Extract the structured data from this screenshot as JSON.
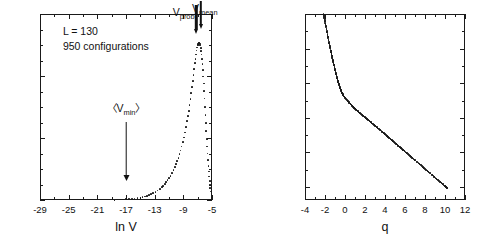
{
  "figure": {
    "background": "#ffffff",
    "ink": "#1a1a1a"
  },
  "left_panel": {
    "annotations": {
      "line1": "L = 130",
      "line2": "950 configurations",
      "v_prob": "V",
      "v_prob_sub": "prob",
      "v_mean": "V",
      "v_mean_sub": "mean",
      "v_min_open": "〈V",
      "v_min_sub": "min",
      "v_min_close": "〉"
    },
    "xlabel": "ln V",
    "ylabel": "",
    "xticks": [
      "-29",
      "-25",
      "-21",
      "-17",
      "-13",
      "-9",
      "-5"
    ],
    "yticks": [
      "0",
      "0.001",
      "0.002",
      "0.003"
    ]
  },
  "right_panel": {
    "xlabel": "q",
    "ylabel_base": "τ",
    "ylabel_sup": "V",
    "ylabel_tail": "(q)",
    "xticks": [
      "-4",
      "-2",
      "0",
      "2",
      "4",
      "6",
      "8",
      "10",
      "12"
    ],
    "yticks": [
      "-8",
      "-4",
      "0",
      "4",
      "8",
      "12"
    ]
  },
  "chart_data": [
    {
      "type": "scatter",
      "id": "distribution-of-ln-V",
      "title": "",
      "xlabel": "ln V",
      "ylabel": "P(ln V)",
      "xlim": [
        -29,
        -5
      ],
      "ylim": [
        0,
        0.003
      ],
      "xticks": [
        -29,
        -25,
        -21,
        -17,
        -13,
        -9,
        -5
      ],
      "yticks": [
        0,
        0.001,
        0.002,
        0.003
      ],
      "grid": false,
      "legend": null,
      "annotations": [
        {
          "text": "L = 130",
          "x": -25.5,
          "y": 0.00272
        },
        {
          "text": "950 configurations",
          "x": -25.5,
          "y": 0.0025
        },
        {
          "text": "〈V_min〉",
          "x": -17.0,
          "y": 0.00148,
          "arrow_to_y": 0.00035
        },
        {
          "text": "V_prob",
          "x": -7.6,
          "y": 0.003,
          "arrow_to_y": 0.00262
        },
        {
          "text": "V_mean",
          "x": -6.3,
          "y": 0.003,
          "arrow_to_y": 0.00262
        }
      ],
      "x": [
        -18.6,
        -18.2,
        -17.8,
        -17.4,
        -17.0,
        -16.6,
        -16.2,
        -15.8,
        -15.4,
        -15.0,
        -14.7,
        -14.4,
        -14.1,
        -13.8,
        -13.5,
        -13.2,
        -12.9,
        -12.6,
        -12.3,
        -12.0,
        -11.8,
        -11.6,
        -11.4,
        -11.2,
        -11.0,
        -10.8,
        -10.6,
        -10.4,
        -10.2,
        -10.0,
        -9.85,
        -9.7,
        -9.55,
        -9.4,
        -9.25,
        -9.1,
        -8.95,
        -8.8,
        -8.65,
        -8.5,
        -8.38,
        -8.26,
        -8.14,
        -8.02,
        -7.9,
        -7.8,
        -7.7,
        -7.6,
        -7.5,
        -7.4,
        -7.32,
        -7.24,
        -7.16,
        -7.08,
        -7.0,
        -6.94,
        -6.88,
        -6.82,
        -6.76,
        -6.7,
        -6.64,
        -6.58,
        -6.52,
        -6.46,
        -6.4,
        -6.34,
        -6.28,
        -6.22,
        -6.16,
        -6.1,
        -6.04,
        -5.98,
        -5.92,
        -5.86,
        -5.8,
        -5.74,
        -5.68,
        -5.62,
        -5.56,
        -5.5,
        -5.44,
        -5.38,
        -5.32,
        -5.28,
        -5.24,
        -5.2
      ],
      "y": [
        5e-06,
        7e-06,
        9e-06,
        1.1e-05,
        1.4e-05,
        1.7e-05,
        2.1e-05,
        2.6e-05,
        3.2e-05,
        4e-05,
        4.8e-05,
        5.8e-05,
        6.9e-05,
        8.2e-05,
        9.7e-05,
        0.000114,
        0.000133,
        0.000155,
        0.00018,
        0.000208,
        0.000232,
        0.000258,
        0.000287,
        0.000319,
        0.000354,
        0.000392,
        0.000434,
        0.00048,
        0.00053,
        0.000585,
        0.000632,
        0.000683,
        0.000738,
        0.000798,
        0.000863,
        0.000933,
        0.001009,
        0.001091,
        0.00118,
        0.001276,
        0.001356,
        0.001441,
        0.001531,
        0.001627,
        0.001729,
        0.00182,
        0.001915,
        0.002012,
        0.00211,
        0.002206,
        0.00228,
        0.00235,
        0.002412,
        0.002462,
        0.002498,
        0.002518,
        0.00253,
        0.002534,
        0.00253,
        0.002516,
        0.002492,
        0.002456,
        0.002408,
        0.002348,
        0.002276,
        0.002192,
        0.002098,
        0.001994,
        0.001882,
        0.001762,
        0.001636,
        0.001506,
        0.001374,
        0.001242,
        0.001112,
        0.000986,
        0.000866,
        0.000752,
        0.000646,
        0.000548,
        0.000458,
        0.000378,
        0.000306,
        0.00025,
        0.000196,
        0.00014
      ]
    },
    {
      "type": "line",
      "id": "tau-V-of-q",
      "title": "",
      "xlabel": "q",
      "ylabel": "τ^V(q)",
      "xlim": [
        -4,
        12
      ],
      "ylim": [
        -9.5,
        12
      ],
      "xticks": [
        -4,
        -2,
        0,
        2,
        4,
        6,
        8,
        10,
        12
      ],
      "yticks": [
        -8,
        -4,
        0,
        4,
        8,
        12
      ],
      "grid": false,
      "legend": null,
      "x": [
        -2.15,
        -2.05,
        -1.95,
        -1.85,
        -1.75,
        -1.65,
        -1.55,
        -1.45,
        -1.35,
        -1.25,
        -1.15,
        -1.05,
        -0.95,
        -0.85,
        -0.75,
        -0.65,
        -0.55,
        -0.45,
        -0.35,
        -0.25,
        -0.1,
        0.1,
        0.3,
        0.5,
        0.7,
        0.9,
        1.1,
        1.3,
        1.5,
        1.75,
        2.0,
        2.25,
        2.5,
        2.75,
        3.0,
        3.3,
        3.6,
        3.9,
        4.2,
        4.5,
        4.8,
        5.1,
        5.4,
        5.7,
        6.0,
        6.4,
        6.8,
        7.2,
        7.6,
        8.0,
        8.4,
        8.8,
        9.2,
        9.6,
        10.0,
        10.2
      ],
      "y": [
        12.0,
        11.4,
        10.8,
        10.2,
        9.6,
        9.0,
        8.45,
        7.9,
        7.35,
        6.8,
        6.3,
        5.8,
        5.3,
        4.85,
        4.4,
        4.0,
        3.62,
        3.3,
        3.02,
        2.78,
        2.48,
        2.18,
        1.9,
        1.64,
        1.4,
        1.17,
        0.95,
        0.74,
        0.54,
        0.3,
        0.06,
        -0.18,
        -0.42,
        -0.66,
        -0.9,
        -1.2,
        -1.5,
        -1.8,
        -2.1,
        -2.4,
        -2.7,
        -3.0,
        -3.3,
        -3.6,
        -3.9,
        -4.3,
        -4.7,
        -5.1,
        -5.5,
        -5.9,
        -6.3,
        -6.7,
        -7.1,
        -7.5,
        -7.9,
        -8.1
      ]
    }
  ]
}
